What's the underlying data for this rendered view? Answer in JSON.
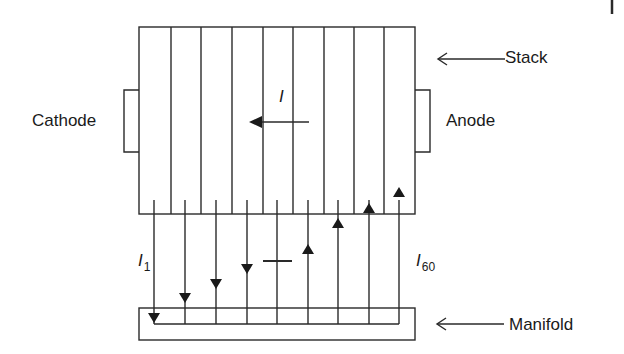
{
  "labels": {
    "stack": "Stack",
    "cathode": "Cathode",
    "anode": "Anode",
    "manifold": "Manifold",
    "current_main": "I",
    "current_first": {
      "symbol": "I",
      "subscript": "1"
    },
    "current_last": {
      "symbol": "I",
      "subscript": "60"
    }
  },
  "diagram": {
    "stack_cells_visible": 9,
    "current_direction_in_stack": "right-to-left",
    "shunt_currents": [
      {
        "index": 1,
        "direction": "down"
      },
      {
        "index": 2,
        "direction": "down"
      },
      {
        "index": 3,
        "direction": "down"
      },
      {
        "index": 4,
        "direction": "down"
      },
      {
        "index": 5,
        "direction": "zero"
      },
      {
        "index": 6,
        "direction": "up"
      },
      {
        "index": 7,
        "direction": "up"
      },
      {
        "index": 8,
        "direction": "up"
      },
      {
        "index": 9,
        "direction": "up"
      }
    ],
    "line_color": "#2a2a2a"
  }
}
